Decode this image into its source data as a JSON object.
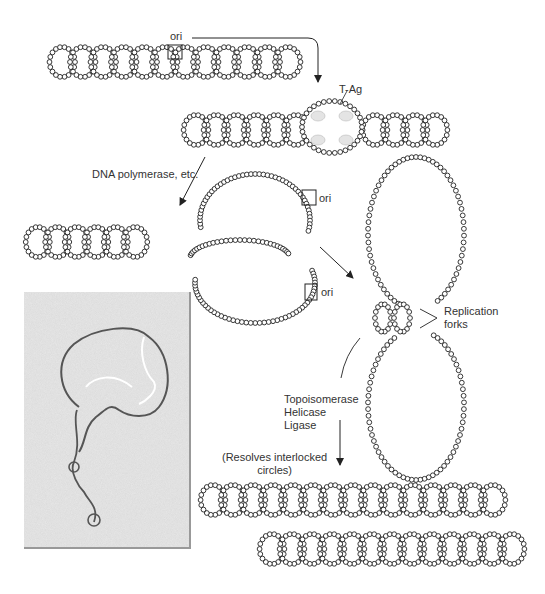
{
  "diagram": {
    "labels": {
      "ori_top": "ori",
      "tag": "T-Ag",
      "polymerase": "DNA polymerase, etc.",
      "ori_mid1": "ori",
      "ori_mid2": "ori",
      "forks_line1": "Replication",
      "forks_line2": "forks",
      "enzymes_line1": "Topoisomerase",
      "enzymes_line2": "Helicase",
      "enzymes_line3": "Ligase",
      "resolves_line1": "(Resolves interlocked",
      "resolves_line2": "circles)"
    },
    "stages": [
      "Supercoiled DNA with origin",
      "T-Ag binds origin and unwinds",
      "Theta replication intermediate",
      "Late replication intermediate with forks",
      "Two daughter supercoiled molecules"
    ],
    "micrograph": "Electron micrograph of replicating DNA"
  }
}
